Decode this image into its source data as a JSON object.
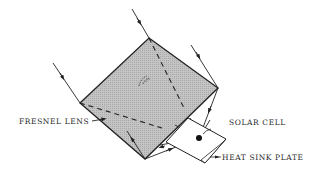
{
  "diagram": {
    "labels": {
      "fresnel_lens": "FRESNEL LENS",
      "solar_cell": "SOLAR CELL",
      "heat_sink_plate": "HEAT SINK PLATE"
    },
    "center_mark": "(͡)",
    "colors": {
      "lens_fill": "#bdbdbd",
      "stroke": "#222222",
      "background": "#ffffff"
    }
  }
}
